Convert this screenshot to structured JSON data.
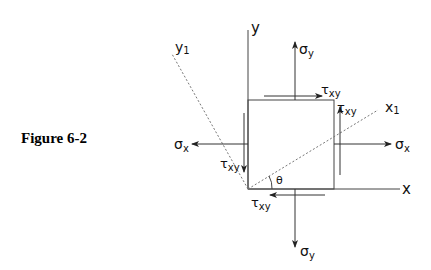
{
  "caption": "Figure 6-2",
  "labels": {
    "y_axis": "y",
    "x_axis": "x",
    "y1_axis": "y",
    "y1_sub": "1",
    "x1_axis": "x",
    "x1_sub": "1",
    "sigma_y_top": "σ",
    "sigma_y_top_sub": "y",
    "sigma_y_bottom": "σ",
    "sigma_y_bottom_sub": "y",
    "sigma_x_left": "σ",
    "sigma_x_left_sub": "x",
    "sigma_x_right": "σ",
    "sigma_x_right_sub": "x",
    "tau_top": "τ",
    "tau_top_sub": "xy",
    "tau_right": "τ",
    "tau_right_sub": "xy",
    "tau_left": "τ",
    "tau_left_sub": "xy",
    "tau_bottom": "τ",
    "tau_bottom_sub": "xy",
    "theta": "θ"
  },
  "colors": {
    "stroke": "#333333",
    "dashed": "#666666"
  }
}
